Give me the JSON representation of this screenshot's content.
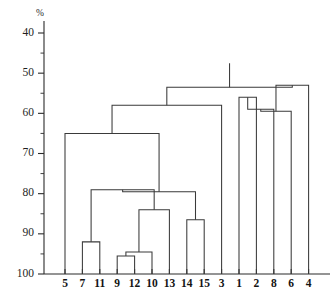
{
  "chart_data": {
    "type": "dendrogram",
    "title": "",
    "subtitle": "",
    "xlabel": "",
    "ylabel": "%",
    "unit_label": "%",
    "y_axis": {
      "inverted": true,
      "top_value": 40,
      "bottom_value": 100,
      "ylim": [
        40,
        100
      ],
      "tick_values": [
        40,
        50,
        60,
        70,
        80,
        90,
        100
      ],
      "tick_labels": [
        "40",
        "50",
        "60",
        "70",
        "80",
        "90",
        "100"
      ],
      "minor_tick_values": [
        45,
        55,
        65,
        75,
        85,
        95
      ],
      "grid": false
    },
    "legend": {
      "visible": false,
      "position": "none",
      "entries": []
    },
    "leaves": [
      {
        "label": "5",
        "order": 0
      },
      {
        "label": "7",
        "order": 1
      },
      {
        "label": "11",
        "order": 2
      },
      {
        "label": "9",
        "order": 3
      },
      {
        "label": "12",
        "order": 4
      },
      {
        "label": "10",
        "order": 5
      },
      {
        "label": "13",
        "order": 6
      },
      {
        "label": "14",
        "order": 7
      },
      {
        "label": "15",
        "order": 8
      },
      {
        "label": "3",
        "order": 9
      },
      {
        "label": "1",
        "order": 10
      },
      {
        "label": "2",
        "order": 11
      },
      {
        "label": "8",
        "order": 12
      },
      {
        "label": "6",
        "order": 13
      },
      {
        "label": "4",
        "order": 14
      }
    ],
    "leaf_labels": [
      "5",
      "7",
      "11",
      "9",
      "12",
      "10",
      "13",
      "14",
      "15",
      "3",
      "1",
      "2",
      "8",
      "6",
      "4"
    ],
    "merges": [
      {
        "id": "m1",
        "left": "7",
        "right": "11",
        "height": 92.0,
        "members": [
          "7",
          "11"
        ]
      },
      {
        "id": "m2",
        "left": "9",
        "right": "12",
        "height": 95.5,
        "members": [
          "9",
          "12"
        ]
      },
      {
        "id": "m3",
        "left": "m2",
        "right": "10",
        "height": 94.5,
        "members": [
          "9",
          "12",
          "10"
        ]
      },
      {
        "id": "m4",
        "left": "m3",
        "right": "13",
        "height": 84.0,
        "members": [
          "9",
          "12",
          "10",
          "13"
        ]
      },
      {
        "id": "m5",
        "left": "14",
        "right": "15",
        "height": 86.5,
        "members": [
          "14",
          "15"
        ]
      },
      {
        "id": "m6",
        "left": "m1",
        "right": "m4",
        "height": 79.0,
        "members": [
          "7",
          "11",
          "9",
          "12",
          "10",
          "13"
        ]
      },
      {
        "id": "m7",
        "left": "m6",
        "right": "m5",
        "height": 79.5,
        "members": [
          "7",
          "11",
          "9",
          "12",
          "10",
          "13",
          "14",
          "15"
        ]
      },
      {
        "id": "m8",
        "left": "5",
        "right": "m7",
        "height": 65.0,
        "members": [
          "5",
          "7",
          "11",
          "9",
          "12",
          "10",
          "13",
          "14",
          "15"
        ]
      },
      {
        "id": "m9",
        "left": "1",
        "right": "2",
        "height": 56.0,
        "members": [
          "1",
          "2"
        ]
      },
      {
        "id": "m10",
        "left": "m9",
        "right": "8",
        "height": 59.0,
        "members": [
          "1",
          "2",
          "8"
        ]
      },
      {
        "id": "m11",
        "left": "m10",
        "right": "6",
        "height": 59.5,
        "members": [
          "1",
          "2",
          "8",
          "6"
        ]
      },
      {
        "id": "m12",
        "left": "m11",
        "right": "4",
        "height": 53.0,
        "members": [
          "1",
          "2",
          "8",
          "6",
          "4"
        ]
      },
      {
        "id": "m13",
        "left": "m8",
        "right": "3",
        "height": 58.0,
        "members": [
          "5",
          "7",
          "11",
          "9",
          "12",
          "10",
          "13",
          "14",
          "15",
          "3"
        ]
      },
      {
        "id": "m14",
        "left": "m13",
        "right": "m12",
        "height": 53.5,
        "members": [
          "all"
        ]
      }
    ],
    "root": {
      "id": "m14",
      "height": 53.5,
      "stem_top_value": 47.5
    }
  }
}
